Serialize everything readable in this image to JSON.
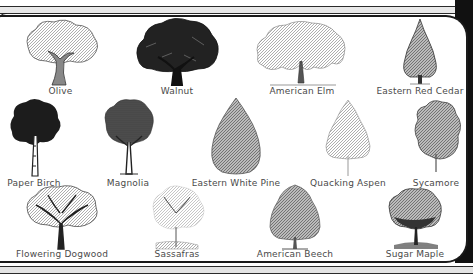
{
  "chart": {
    "rows": [
      [
        {
          "name": "Olive",
          "style": "olive"
        },
        {
          "name": "Walnut",
          "style": "walnut"
        },
        {
          "name": "American Elm",
          "style": "elm"
        },
        {
          "name": "Eastern Red Cedar",
          "style": "cedar"
        }
      ],
      [
        {
          "name": "Paper Birch",
          "style": "birch"
        },
        {
          "name": "Magnolia",
          "style": "magnolia"
        },
        {
          "name": "Eastern White Pine",
          "style": "pine"
        },
        {
          "name": "Quacking Aspen",
          "style": "aspen"
        },
        {
          "name": "Sycamore",
          "style": "sycamore"
        }
      ],
      [
        {
          "name": "Flowering Dogwood",
          "style": "dogwood"
        },
        {
          "name": "Sassafras",
          "style": "sassafras"
        },
        {
          "name": "American Beech",
          "style": "beech"
        },
        {
          "name": "Sugar Maple",
          "style": "maple"
        }
      ]
    ]
  },
  "trees": {
    "olive": "Olive",
    "walnut": "Walnut",
    "american_elm": "American Elm",
    "eastern_red_cedar": "Eastern Red Cedar",
    "paper_birch": "Paper Birch",
    "magnolia": "Magnolia",
    "eastern_white_pine": "Eastern White Pine",
    "quacking_aspen": "Quacking Aspen",
    "sycamore": "Sycamore",
    "flowering_dogwood": "Flowering Dogwood",
    "sassafras": "Sassafras",
    "american_beech": "American Beech",
    "sugar_maple": "Sugar Maple"
  },
  "colors": {
    "frame": "#1a1a1a",
    "label": "#4a4a4a",
    "background": "#ffffff"
  }
}
